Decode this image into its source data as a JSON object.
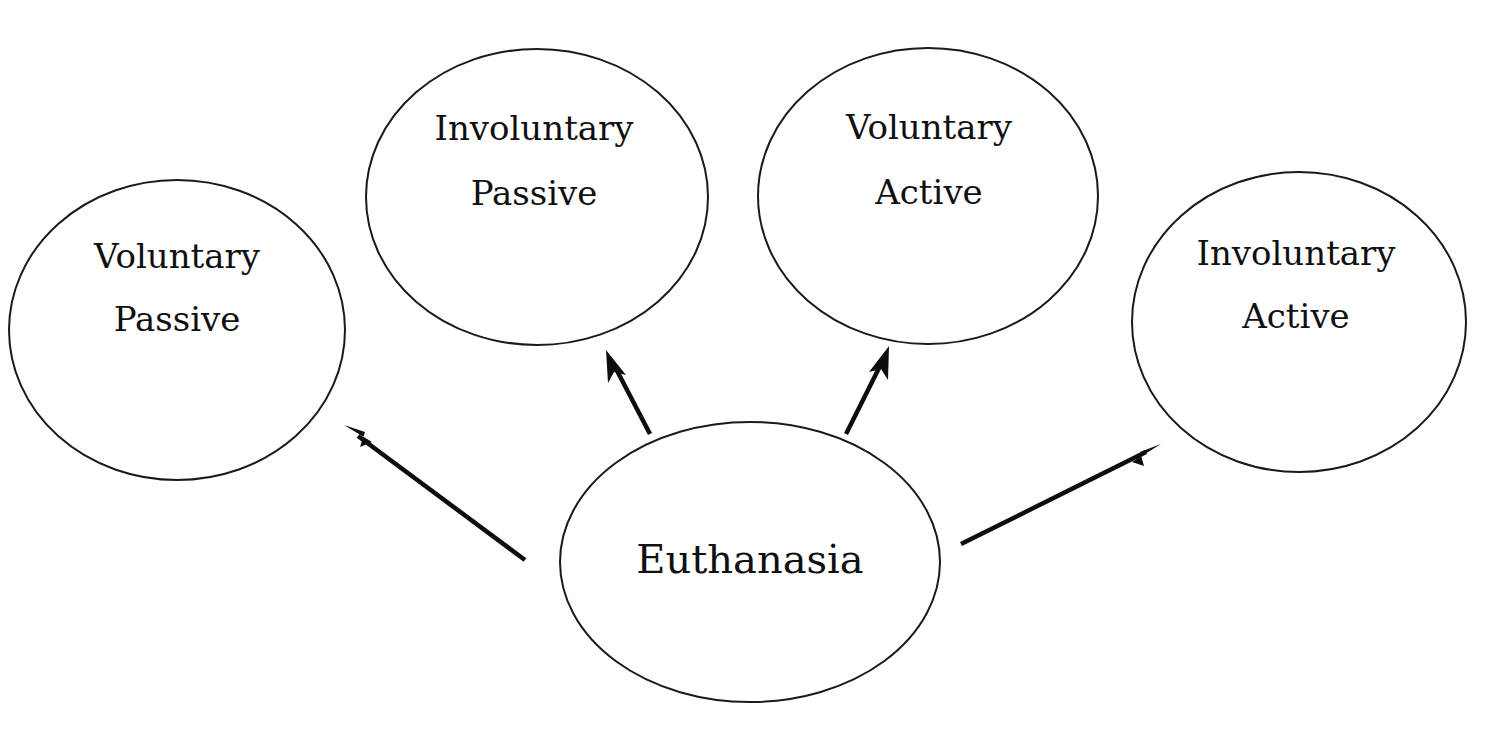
{
  "diagram": {
    "background_color": "#ffffff",
    "stroke_color": "#1a1a1a",
    "text_color": "#101010",
    "arrow_color": "#0d0d0d",
    "root": {
      "id": "euthanasia",
      "label": "Euthanasia",
      "cx": 750,
      "cy": 562,
      "rx": 190,
      "ry": 140
    },
    "nodes": [
      {
        "id": "voluntary-passive",
        "label_line1": "Voluntary",
        "label_line2": "Passive",
        "cx": 177,
        "cy": 330,
        "rx": 168,
        "ry": 150
      },
      {
        "id": "involuntary-passive",
        "label_line1": "Involuntary",
        "label_line2": "Passive",
        "cx": 537,
        "cy": 197,
        "rx": 171,
        "ry": 148
      },
      {
        "id": "voluntary-active",
        "label_line1": "Voluntary",
        "label_line2": "Active",
        "cx": 928,
        "cy": 196,
        "rx": 170,
        "ry": 148
      },
      {
        "id": "involuntary-active",
        "label_line1": "Involuntary",
        "label_line2": "Active",
        "cx": 1299,
        "cy": 322,
        "rx": 167,
        "ry": 150
      }
    ],
    "edges": [
      {
        "id": "edge-to-voluntary-passive",
        "from": "euthanasia",
        "to": "voluntary-passive",
        "x1": 525,
        "y1": 560,
        "x2": 344,
        "y2": 425
      },
      {
        "id": "edge-to-involuntary-passive",
        "from": "euthanasia",
        "to": "involuntary-passive",
        "x1": 650,
        "y1": 434,
        "x2": 606,
        "y2": 350
      },
      {
        "id": "edge-to-voluntary-active",
        "from": "euthanasia",
        "to": "voluntary-active",
        "x1": 846,
        "y1": 434,
        "x2": 889,
        "y2": 346
      },
      {
        "id": "edge-to-involuntary-active",
        "from": "euthanasia",
        "to": "involuntary-active",
        "x1": 961,
        "y1": 544,
        "x2": 1161,
        "y2": 444
      }
    ]
  }
}
